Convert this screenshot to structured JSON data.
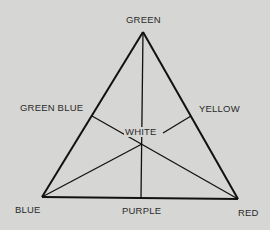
{
  "diagram": {
    "vertices": {
      "top": "GREEN",
      "bottom_left": "BLUE",
      "bottom_right": "RED"
    },
    "edge_midpoints": {
      "left": "GREEN BLUE",
      "right": "YELLOW",
      "bottom": "PURPLE"
    },
    "center": "WHITE",
    "colors": {
      "background": "#d6d6d4",
      "line": "#111111",
      "text": "#2a2a2a"
    }
  }
}
